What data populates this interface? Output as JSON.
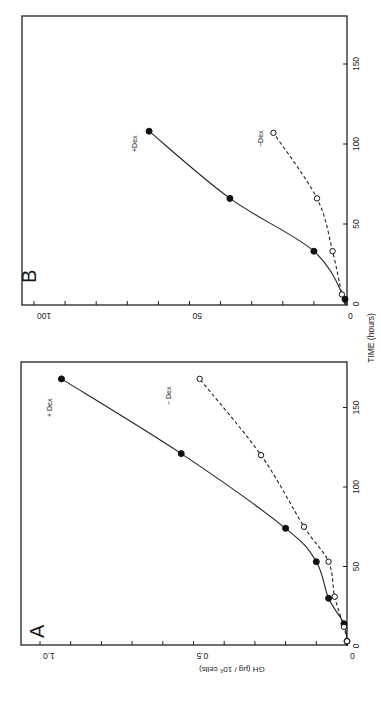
{
  "figure": {
    "x_axis_title": "TIME (hours)",
    "y_axis_title": "GH (µg / 10⁶ cells)",
    "orientation": "rotated 90° clockwise"
  },
  "chart_data": [
    {
      "panel": "A",
      "type": "line",
      "title": "A",
      "xlabel": "TIME (hours)",
      "ylabel": "GH (µg / 10⁶ cells)",
      "xlim": [
        0,
        180
      ],
      "ylim": [
        0,
        1.05
      ],
      "xticks": [
        0,
        50,
        100,
        150
      ],
      "yticks": [
        0,
        0.5,
        1.0
      ],
      "ytick_labels": [
        "0",
        "0.5",
        "1.0"
      ],
      "y_minor_step": 0.1,
      "grid": false,
      "series": [
        {
          "name": "+Dex",
          "label": "+ Dex",
          "marker": "filled-circle",
          "line": "solid",
          "x": [
            3,
            14,
            30,
            53,
            74,
            121,
            168
          ],
          "values": [
            0.0,
            0.01,
            0.06,
            0.1,
            0.2,
            0.54,
            0.93
          ]
        },
        {
          "name": "-Dex",
          "label": "− Dex",
          "marker": "open-circle",
          "line": "dashed",
          "x": [
            3,
            12,
            31,
            53,
            75,
            120,
            168
          ],
          "values": [
            0.0,
            0.01,
            0.04,
            0.06,
            0.14,
            0.28,
            0.48
          ]
        }
      ]
    },
    {
      "panel": "B",
      "type": "line",
      "title": "B",
      "xlabel": "TIME (hours)",
      "ylabel": "",
      "xlim": [
        0,
        180
      ],
      "ylim": [
        0,
        103
      ],
      "xticks": [
        0,
        50,
        100,
        150
      ],
      "yticks": [
        0,
        50,
        100
      ],
      "ytick_labels": [
        "0",
        "50",
        "100"
      ],
      "y_minor_step": 10,
      "grid": false,
      "series": [
        {
          "name": "+Dex",
          "label": "+Dex",
          "marker": "filled-circle",
          "line": "solid",
          "x": [
            3,
            33,
            66,
            108
          ],
          "values": [
            0,
            10,
            37,
            63
          ]
        },
        {
          "name": "-Dex",
          "label": "−Dex",
          "marker": "open-circle",
          "line": "dashed",
          "x": [
            6,
            33,
            66,
            107
          ],
          "values": [
            1,
            4,
            9,
            23
          ]
        }
      ]
    }
  ]
}
